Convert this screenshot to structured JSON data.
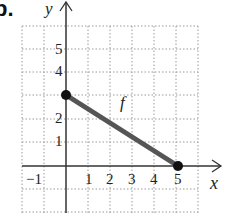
{
  "problem_label": "b.",
  "axes": {
    "x_label": "x",
    "y_label": "y",
    "x_ticks": [
      "−1",
      "1",
      "2",
      "3",
      "4",
      "5"
    ],
    "y_ticks": [
      "1",
      "2",
      "4",
      "5"
    ]
  },
  "function_label": "f",
  "segment": {
    "start": {
      "x": 0,
      "y": 3,
      "closed": true
    },
    "end": {
      "x": 5,
      "y": 0,
      "closed": true
    }
  },
  "grid": {
    "x_range": [
      -2,
      6
    ],
    "y_range": [
      -2,
      6
    ],
    "step": 1,
    "style": "dotted"
  },
  "colors": {
    "axis": "#333333",
    "segment": "#555555",
    "grid": "#999999",
    "point": "#111111"
  }
}
